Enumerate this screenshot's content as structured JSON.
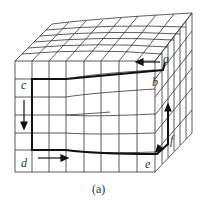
{
  "figure": {
    "caption": "(a)",
    "circuit_labels": {
      "a": "a",
      "b": "b",
      "c": "c",
      "d": "d",
      "e": "e",
      "f": "f"
    },
    "colors": {
      "grid": "#333333",
      "circuit": "#111111",
      "background": "#ffffff"
    }
  }
}
